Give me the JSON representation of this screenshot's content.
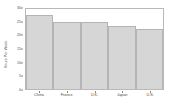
{
  "chart_data": {
    "type": "bar",
    "title": "",
    "xlabel": "",
    "ylabel": "Hours Per Week",
    "categories": [
      "China",
      "France",
      "U.K.",
      "Japan",
      "U.S."
    ],
    "values": [
      27,
      24.5,
      24.5,
      23,
      22
    ],
    "ylim": [
      0,
      30
    ],
    "yticks": [
      0,
      5,
      10,
      15,
      20,
      25,
      30
    ],
    "ytick_labels": [
      "0",
      "5",
      "10",
      "15",
      "20",
      "25",
      "30"
    ],
    "grid": false,
    "legend": null,
    "colors": {
      "bar_fill": "#d6d6d6",
      "bar_edge": "#b4b4b4",
      "axis": "#b9b9b9",
      "text": "#4a4a4a",
      "background": "#ffffff"
    }
  }
}
